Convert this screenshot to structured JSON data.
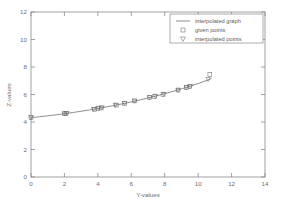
{
  "chart_data": {
    "type": "line",
    "title": "",
    "xlabel": "Y-values",
    "ylabel": "Z-values",
    "xlim": [
      0,
      14
    ],
    "ylim": [
      0,
      12
    ],
    "xticks": [
      0,
      2,
      4,
      6,
      8,
      10,
      12,
      14
    ],
    "yticks": [
      0,
      2,
      4,
      6,
      8,
      10,
      12
    ],
    "xtick_labels": [
      "0",
      "2",
      "4",
      "6",
      "8",
      "10",
      "12",
      "14"
    ],
    "ytick_labels": [
      "0",
      "2",
      "4",
      "6",
      "8",
      "10",
      "12"
    ],
    "grid": false,
    "legend_position": "top-right",
    "series": [
      {
        "name": "interpolated graph",
        "marker": "none",
        "style": "line",
        "color": "#5d5d5d",
        "x": [
          0.0,
          0.5,
          1.0,
          1.5,
          2.0,
          2.5,
          3.0,
          3.5,
          4.0,
          4.5,
          5.0,
          5.5,
          6.0,
          6.5,
          7.0,
          7.5,
          8.0,
          8.5,
          9.0,
          9.5,
          10.0,
          10.3,
          10.6,
          10.8
        ],
        "y": [
          4.32,
          4.38,
          4.45,
          4.52,
          4.6,
          4.69,
          4.78,
          4.88,
          4.98,
          5.09,
          5.21,
          5.33,
          5.46,
          5.6,
          5.75,
          5.9,
          6.06,
          6.23,
          6.41,
          6.6,
          6.8,
          6.93,
          7.06,
          7.16
        ]
      },
      {
        "name": "given points",
        "marker": "square",
        "style": "markers",
        "color": "#6a6a6a",
        "x": [
          0.0,
          2.0,
          2.1,
          3.8,
          4.0,
          4.2,
          5.1,
          5.6,
          6.2,
          7.1,
          7.4,
          7.9,
          8.8,
          9.3,
          9.5,
          10.7
        ],
        "y": [
          4.32,
          4.6,
          4.62,
          4.93,
          4.98,
          5.02,
          5.23,
          5.36,
          5.53,
          5.78,
          5.86,
          6.01,
          6.32,
          6.5,
          6.58,
          7.45
        ]
      },
      {
        "name": "interpolated points",
        "marker": "triangle-down",
        "style": "markers",
        "color": "#6a6a6a",
        "x": [
          0.0,
          2.0,
          2.15,
          3.75,
          4.05,
          4.25,
          5.05,
          5.6,
          6.2,
          7.1,
          7.45,
          7.95,
          8.8,
          9.3,
          9.55,
          10.6
        ],
        "y": [
          4.32,
          4.6,
          4.63,
          4.92,
          5.0,
          5.04,
          5.22,
          5.36,
          5.53,
          5.78,
          5.87,
          6.02,
          6.32,
          6.5,
          6.59,
          7.1
        ]
      }
    ]
  },
  "legend": {
    "entries": [
      {
        "label": "interpolated graph",
        "symbol": "line"
      },
      {
        "label": "given points",
        "symbol": "square"
      },
      {
        "label": "interpolated points",
        "symbol": "triangle-down"
      }
    ]
  },
  "axes": {
    "x_title": "Y-values",
    "y_title": "Z-values"
  }
}
